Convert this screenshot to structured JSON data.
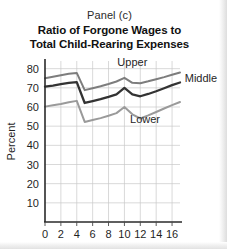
{
  "figure": {
    "panel_label": "Panel (c)",
    "title_line1": "Ratio of Forgone Wages to",
    "title_line2": "Total Child-Rearing Expenses"
  },
  "colors": {
    "upper_line": "#7d7d7d",
    "middle_line": "#333333",
    "lower_line": "#9a9a9a",
    "gridline": "#c9c9c9",
    "axis": "#2a2a2a",
    "text": "#1f1f1f",
    "background": "#ffffff"
  },
  "chart_data": {
    "type": "line",
    "title": "Ratio of Forgone Wages to Total Child-Rearing Expenses",
    "subtitle": "Panel (c)",
    "xlabel": "",
    "ylabel": "Percent",
    "xlim": [
      0,
      17
    ],
    "ylim": [
      0,
      84
    ],
    "xticks": [
      0,
      2,
      4,
      6,
      8,
      10,
      12,
      14,
      16
    ],
    "xtick_labels": [
      "0",
      "2",
      "4",
      "6",
      "8",
      "10",
      "12",
      "14",
      "16"
    ],
    "yticks": [
      10,
      20,
      30,
      40,
      50,
      60,
      70,
      80
    ],
    "ytick_labels": [
      "10",
      "20",
      "30",
      "40",
      "50",
      "60",
      "70",
      "80"
    ],
    "grid": true,
    "legend_position": "inline-annotations",
    "x": [
      0,
      1,
      2,
      3,
      4,
      5,
      6,
      7,
      8,
      9,
      10,
      11,
      12,
      13,
      14,
      15,
      16,
      17
    ],
    "series": [
      {
        "name": "Upper",
        "label": "Upper",
        "color": "#7d7d7d",
        "values": [
          75.0,
          75.8,
          76.6,
          77.3,
          77.8,
          68.8,
          69.8,
          70.8,
          72.0,
          73.3,
          75.2,
          72.6,
          72.4,
          73.4,
          74.5,
          75.6,
          76.8,
          78.0
        ]
      },
      {
        "name": "Middle",
        "label": "Middle",
        "color": "#333333",
        "values": [
          70.6,
          71.2,
          71.9,
          72.6,
          73.0,
          62.1,
          63.1,
          64.1,
          65.3,
          66.6,
          70.0,
          66.6,
          65.6,
          66.8,
          68.2,
          69.8,
          71.4,
          72.8
        ]
      },
      {
        "name": "Lower",
        "label": "Lower",
        "color": "#9a9a9a",
        "values": [
          60.2,
          60.9,
          61.6,
          62.5,
          63.2,
          52.2,
          53.2,
          54.2,
          55.4,
          56.8,
          60.0,
          56.2,
          54.0,
          55.6,
          57.4,
          59.2,
          61.0,
          62.6
        ]
      }
    ],
    "annotations": [
      {
        "text": "Upper",
        "x": 11.0,
        "y": 81.5,
        "anchor": "middle"
      },
      {
        "text": "Middle",
        "x": 17.6,
        "y": 73.2,
        "anchor": "start"
      },
      {
        "text": "Lower",
        "x": 12.6,
        "y": 51.8,
        "anchor": "middle"
      }
    ]
  }
}
